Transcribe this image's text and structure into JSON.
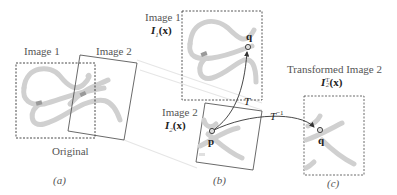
{
  "panel_a": {
    "image1_label": "Image 1",
    "image2_label": "Image 2",
    "original_label": "Original",
    "caption": "(a)"
  },
  "panel_b": {
    "image1_label": "Image 1",
    "image1_func_I": "I",
    "image1_func_sub": "1",
    "image1_func_arg": "(x)",
    "image2_label": "Image 2",
    "image2_func_I": "I",
    "image2_func_sub": "2",
    "image2_func_arg": "(x)",
    "point_q": "q",
    "point_p": "p",
    "transform_label": "T",
    "caption": "(b)"
  },
  "panel_c": {
    "title": "Transformed Image 2",
    "func_I": "I",
    "func_sub": "2",
    "func_sup": "T",
    "func_arg": "(x)",
    "point_q": "q",
    "caption": "(c)"
  },
  "inverse_transform": {
    "base": "T",
    "sup": "−1"
  },
  "colors": {
    "stroke_band": "#c8c8c8",
    "frame": "#444444",
    "arrow": "#333333",
    "text": "#555555"
  }
}
